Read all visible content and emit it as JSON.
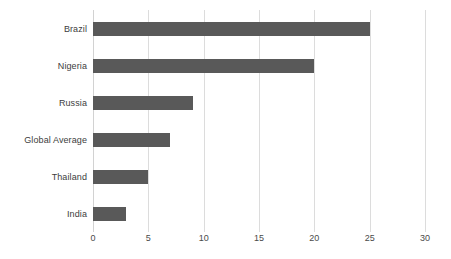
{
  "chart_data": {
    "type": "bar",
    "orientation": "horizontal",
    "title": "",
    "xlabel": "",
    "ylabel": "",
    "categories": [
      "Brazil",
      "Nigeria",
      "Russia",
      "Global Average",
      "Thailand",
      "India"
    ],
    "values": [
      25,
      20,
      9,
      7,
      5,
      3
    ],
    "series": [
      {
        "name": "",
        "values": [
          25,
          20,
          9,
          7,
          5,
          3
        ]
      }
    ],
    "xlim": [
      0,
      30
    ],
    "xticks": [
      0,
      5,
      10,
      15,
      20,
      25,
      30
    ],
    "xtick_labels": [
      "0",
      "5",
      "10",
      "15",
      "20",
      "25",
      "30"
    ],
    "grid": "vertical",
    "legend": "none",
    "bar_color": "#595959",
    "gridline_color": "#dcdcdc",
    "background_color": "#ffffff",
    "label_color": "#3d3d3d"
  },
  "caption": {
    "text": ""
  }
}
